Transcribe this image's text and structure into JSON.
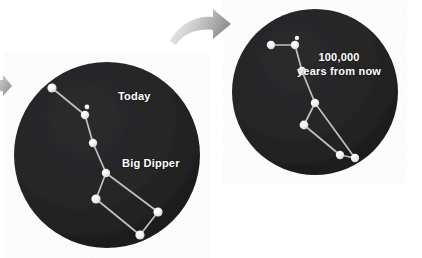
{
  "figure": {
    "background_color": "#ffffff",
    "width": 422,
    "height": 258
  },
  "colors": {
    "sky_fill": "#252526",
    "sky_fill_dark": "#1d1d1e",
    "star_fill": "#f2f2ee",
    "star_glow": "#ffffff",
    "link_line": "#cfcfca",
    "label_text": "#ffffff",
    "arrow_gray_light": "#e9e9e9",
    "arrow_gray_dark": "#9a9a9a"
  },
  "panels": [
    {
      "name": "today-panel",
      "label": "Today",
      "circle": {
        "cx": 107,
        "cy": 155,
        "r": 93
      },
      "label_position": {
        "x": 118,
        "y": 90
      },
      "secondary_label": "Big Dipper",
      "secondary_label_position": {
        "x": 122,
        "y": 157
      },
      "stars": [
        {
          "id": "alkaid",
          "x": 52,
          "y": 88,
          "r": 4.6
        },
        {
          "id": "mizar-b",
          "x": 87,
          "y": 107,
          "r": 2.4
        },
        {
          "id": "mizar",
          "x": 85,
          "y": 115,
          "r": 4.2
        },
        {
          "id": "alioth",
          "x": 93,
          "y": 143,
          "r": 4.2
        },
        {
          "id": "megrez",
          "x": 106,
          "y": 173,
          "r": 4.2
        },
        {
          "id": "phecda",
          "x": 96,
          "y": 199,
          "r": 4.6
        },
        {
          "id": "merak",
          "x": 140,
          "y": 235,
          "r": 4.6
        },
        {
          "id": "dubhe",
          "x": 158,
          "y": 212,
          "r": 4.6
        }
      ],
      "links": [
        [
          "alkaid",
          "mizar"
        ],
        [
          "mizar",
          "alioth"
        ],
        [
          "alioth",
          "megrez"
        ],
        [
          "megrez",
          "phecda"
        ],
        [
          "phecda",
          "merak"
        ],
        [
          "merak",
          "dubhe"
        ],
        [
          "dubhe",
          "megrez"
        ]
      ]
    },
    {
      "name": "future-panel",
      "label_lines": [
        "100,000",
        "years from now"
      ],
      "circle": {
        "cx": 315,
        "cy": 92,
        "r": 83
      },
      "label_position": {
        "x": 297,
        "y": 51
      },
      "stars": [
        {
          "id": "alkaid",
          "x": 271,
          "y": 45,
          "r": 4.2
        },
        {
          "id": "mizar-b",
          "x": 297,
          "y": 38,
          "r": 2.2
        },
        {
          "id": "mizar",
          "x": 295,
          "y": 45,
          "r": 4.2
        },
        {
          "id": "alioth",
          "x": 302,
          "y": 71,
          "r": 4.2
        },
        {
          "id": "megrez",
          "x": 315,
          "y": 103,
          "r": 4.2
        },
        {
          "id": "phecda",
          "x": 304,
          "y": 125,
          "r": 4.4
        },
        {
          "id": "merak",
          "x": 340,
          "y": 155,
          "r": 4.2
        },
        {
          "id": "dubhe",
          "x": 355,
          "y": 158,
          "r": 4.2
        }
      ],
      "links": [
        [
          "alkaid",
          "mizar"
        ],
        [
          "mizar",
          "alioth"
        ],
        [
          "alioth",
          "megrez"
        ],
        [
          "megrez",
          "phecda"
        ],
        [
          "phecda",
          "merak"
        ],
        [
          "merak",
          "dubhe"
        ],
        [
          "dubhe",
          "megrez"
        ]
      ]
    }
  ],
  "arrows": [
    {
      "name": "transition-arrow",
      "direction": "right",
      "position": {
        "x": 168,
        "y": 10,
        "width": 62,
        "height": 40
      }
    },
    {
      "name": "incoming-arrow-clipped",
      "direction": "right",
      "position": {
        "x": -10,
        "y": 78,
        "width": 20,
        "height": 18
      }
    }
  ]
}
